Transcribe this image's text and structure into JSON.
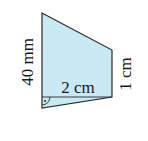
{
  "diagram": {
    "type": "trapezoid-geometry-figure",
    "fill_color": "#c9e9f5",
    "stroke_color": "#2a2a2a",
    "shape": {
      "vertices": [
        [
          42,
          13
        ],
        [
          112,
          50
        ],
        [
          112,
          97
        ],
        [
          42,
          108
        ]
      ]
    },
    "inner_line": {
      "from": [
        42,
        97
      ],
      "to": [
        112,
        97
      ]
    },
    "right_angle_marker": {
      "at": [
        42,
        97
      ],
      "has_dot": true
    },
    "labels": {
      "left_side": "40 mm",
      "inner_width": "2 cm",
      "right_side": "1 cm"
    }
  }
}
